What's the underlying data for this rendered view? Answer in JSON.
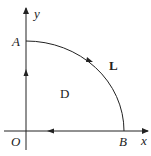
{
  "diagram": {
    "title": "",
    "axes": {
      "x_label": "x",
      "y_label": "y",
      "origin_label": "O"
    },
    "points": {
      "A": "A",
      "B": "B"
    },
    "curve_label": "L",
    "region_label": "D",
    "colors": {
      "stroke": "#222222",
      "background": "#ffffff"
    }
  }
}
